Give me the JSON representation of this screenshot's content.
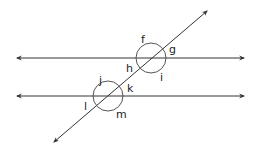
{
  "diagram": {
    "line_color": "#333333",
    "parallel_lines": [
      {
        "id": "upper",
        "x1": 17,
        "y": 58,
        "x2": 244
      },
      {
        "id": "lower",
        "x1": 17,
        "y": 96,
        "x2": 244
      }
    ],
    "transversal": {
      "x1": 54,
      "y1": 142,
      "x2": 207,
      "y2": 11
    },
    "intersections": [
      {
        "id": "upper",
        "cx": 151,
        "cy": 58,
        "r": 15
      },
      {
        "id": "lower",
        "cx": 108,
        "cy": 96,
        "r": 15
      }
    ],
    "angle_labels": [
      {
        "text": "f",
        "x": 141,
        "y": 43
      },
      {
        "text": "g",
        "x": 169,
        "y": 53
      },
      {
        "text": "h",
        "x": 126,
        "y": 72
      },
      {
        "text": "i",
        "x": 160,
        "y": 81
      },
      {
        "text": "j",
        "x": 99,
        "y": 84
      },
      {
        "text": "k",
        "x": 127,
        "y": 92
      },
      {
        "text": "l",
        "x": 84,
        "y": 110
      },
      {
        "text": "m",
        "x": 116,
        "y": 118
      }
    ]
  }
}
